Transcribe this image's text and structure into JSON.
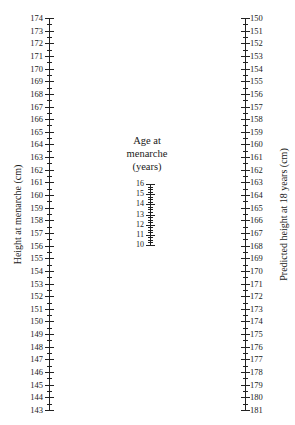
{
  "chart_data": {
    "type": "nomogram",
    "title": "",
    "scales": [
      {
        "name": "Height at menarche (cm)",
        "position": "left",
        "min": 143,
        "max": 174,
        "direction": "top-to-bottom descending",
        "tick_labels": [
          174,
          173,
          172,
          171,
          170,
          169,
          168,
          167,
          166,
          165,
          164,
          163,
          162,
          161,
          160,
          159,
          158,
          157,
          156,
          155,
          154,
          153,
          152,
          151,
          150,
          149,
          148,
          147,
          146,
          145,
          144,
          143
        ],
        "minor_ticks_per_unit": 2
      },
      {
        "name": "Age at menarche (years)",
        "position": "center",
        "min": 10,
        "max": 16,
        "direction": "top-to-bottom descending",
        "tick_labels": [
          16,
          15,
          14,
          13,
          12,
          11,
          10
        ],
        "minor_ticks_per_unit": 4
      },
      {
        "name": "Predicted height at 18 years (cm)",
        "position": "right",
        "min": 150,
        "max": 181,
        "direction": "top-to-bottom ascending",
        "tick_labels": [
          150,
          151,
          152,
          153,
          154,
          155,
          156,
          157,
          158,
          159,
          160,
          161,
          162,
          163,
          164,
          165,
          166,
          167,
          168,
          169,
          170,
          171,
          172,
          173,
          174,
          175,
          176,
          177,
          178,
          179,
          180,
          181
        ],
        "minor_ticks_per_unit": 2
      }
    ]
  },
  "labels": {
    "left_title": "Height at menarche (cm)",
    "middle_title_line1": "Age at",
    "middle_title_line2": "menarche",
    "middle_title_line3": "(years)",
    "right_title": "Predicted height at 18 years (cm)"
  }
}
